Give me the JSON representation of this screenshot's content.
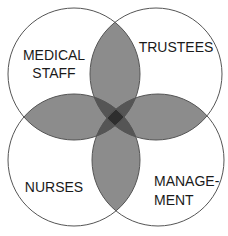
{
  "diagram": {
    "type": "venn",
    "sets": [
      {
        "id": "medical_staff",
        "label_lines": [
          "MEDICAL",
          "STAFF"
        ]
      },
      {
        "id": "trustees",
        "label_lines": [
          "TRUSTEES"
        ]
      },
      {
        "id": "nurses",
        "label_lines": [
          "NURSES"
        ]
      },
      {
        "id": "management",
        "label_lines": [
          "MANAGE-",
          "MENT"
        ]
      }
    ],
    "colors": {
      "background": "#ffffff",
      "outline": "#555555",
      "overlap_two": "#8c8c8c",
      "overlap_three": "#555555",
      "overlap_four": "#2e2e2e",
      "text": "#1a1a1a"
    }
  }
}
